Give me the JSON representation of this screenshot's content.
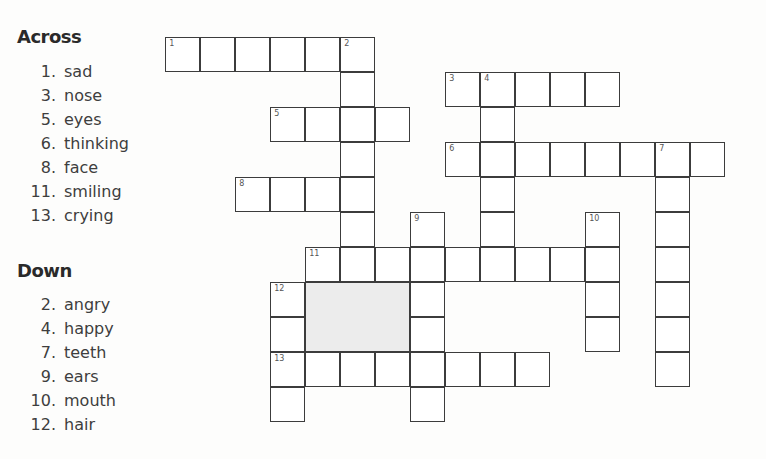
{
  "across": {
    "heading": "Across",
    "clues": [
      {
        "num": "1.",
        "text": "sad"
      },
      {
        "num": "3.",
        "text": "nose"
      },
      {
        "num": "5.",
        "text": "eyes"
      },
      {
        "num": "6.",
        "text": "thinking"
      },
      {
        "num": "8.",
        "text": "face"
      },
      {
        "num": "11.",
        "text": "smiling"
      },
      {
        "num": "13.",
        "text": "crying"
      }
    ]
  },
  "down": {
    "heading": "Down",
    "clues": [
      {
        "num": "2.",
        "text": "angry"
      },
      {
        "num": "4.",
        "text": "happy"
      },
      {
        "num": "7.",
        "text": "teeth"
      },
      {
        "num": "9.",
        "text": "ears"
      },
      {
        "num": "10.",
        "text": "mouth"
      },
      {
        "num": "12.",
        "text": "hair"
      }
    ]
  },
  "grid": {
    "origin_x": 166,
    "origin_y": 38,
    "cell_size": 35,
    "shaded_block": {
      "col": 4,
      "row": 7,
      "cols": 3,
      "rows": 2,
      "color": "#ececec"
    },
    "cells": [
      [
        0,
        0,
        "1"
      ],
      [
        1,
        0
      ],
      [
        2,
        0
      ],
      [
        3,
        0
      ],
      [
        4,
        0
      ],
      [
        5,
        0,
        "2"
      ],
      [
        5,
        1
      ],
      [
        8,
        1,
        "3"
      ],
      [
        9,
        1,
        "4"
      ],
      [
        10,
        1
      ],
      [
        11,
        1
      ],
      [
        12,
        1
      ],
      [
        3,
        2,
        "5"
      ],
      [
        4,
        2
      ],
      [
        5,
        2
      ],
      [
        6,
        2
      ],
      [
        9,
        2
      ],
      [
        5,
        3
      ],
      [
        8,
        3,
        "6"
      ],
      [
        9,
        3
      ],
      [
        10,
        3
      ],
      [
        11,
        3
      ],
      [
        12,
        3
      ],
      [
        13,
        3
      ],
      [
        14,
        3,
        "7"
      ],
      [
        15,
        3
      ],
      [
        2,
        4,
        "8"
      ],
      [
        3,
        4
      ],
      [
        4,
        4
      ],
      [
        5,
        4
      ],
      [
        9,
        4
      ],
      [
        14,
        4
      ],
      [
        5,
        5
      ],
      [
        7,
        5,
        "9"
      ],
      [
        9,
        5
      ],
      [
        12,
        5,
        "10"
      ],
      [
        14,
        5
      ],
      [
        4,
        6,
        "11"
      ],
      [
        5,
        6
      ],
      [
        6,
        6
      ],
      [
        7,
        6
      ],
      [
        8,
        6
      ],
      [
        9,
        6
      ],
      [
        10,
        6
      ],
      [
        11,
        6
      ],
      [
        12,
        6
      ],
      [
        14,
        6
      ],
      [
        3,
        7,
        "12"
      ],
      [
        7,
        7
      ],
      [
        12,
        7
      ],
      [
        14,
        7
      ],
      [
        3,
        8
      ],
      [
        7,
        8
      ],
      [
        12,
        8
      ],
      [
        14,
        8
      ],
      [
        3,
        9,
        "13"
      ],
      [
        4,
        9
      ],
      [
        5,
        9
      ],
      [
        6,
        9
      ],
      [
        7,
        9
      ],
      [
        8,
        9
      ],
      [
        9,
        9
      ],
      [
        10,
        9
      ],
      [
        14,
        9
      ],
      [
        3,
        10
      ],
      [
        7,
        10
      ]
    ]
  }
}
